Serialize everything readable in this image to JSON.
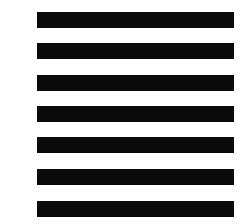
{
  "figure": {
    "background": "#ffffff",
    "bar_color": "#0a0a0a",
    "bar_count": 7,
    "bars": [
      {
        "index": 1,
        "top": 12
      },
      {
        "index": 2,
        "top": 43
      },
      {
        "index": 3,
        "top": 75
      },
      {
        "index": 4,
        "top": 106
      },
      {
        "index": 5,
        "top": 137
      },
      {
        "index": 6,
        "top": 169
      },
      {
        "index": 7,
        "top": 201
      }
    ]
  }
}
